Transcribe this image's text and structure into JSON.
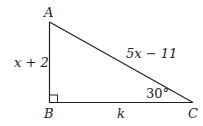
{
  "diagram": {
    "type": "right-triangle",
    "vertices": {
      "A": {
        "label": "A"
      },
      "B": {
        "label": "B"
      },
      "C": {
        "label": "C"
      }
    },
    "sides": {
      "AB": "x + 2",
      "AC": "5x − 11",
      "BC": "k"
    },
    "angle_C": "30°",
    "right_angle_at": "B"
  }
}
